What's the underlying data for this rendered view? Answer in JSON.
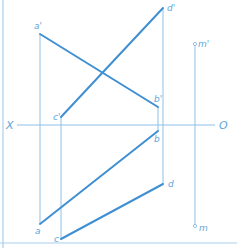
{
  "diagram": {
    "type": "orthographic-projection",
    "colors": {
      "thick_line": "#3f8fd2",
      "thin_line": "#8fc0e6",
      "label": "#5ea4da",
      "border": "#a9cfee"
    },
    "axis": {
      "left_label": "X",
      "right_label": "O"
    },
    "labels": {
      "a_prime": "a'",
      "b_prime": "b'",
      "c_prime": "c'",
      "d_prime": "d'",
      "m_prime": "m'",
      "a": "a",
      "b": "b",
      "c": "c",
      "d": "d",
      "m": "m"
    },
    "points": {
      "a_prime": [
        40,
        34
      ],
      "b_prime": [
        158,
        107
      ],
      "c_prime": [
        61,
        117
      ],
      "d_prime": [
        163,
        8
      ],
      "m_prime": [
        195,
        44
      ],
      "a": [
        40,
        224
      ],
      "b": [
        158,
        131
      ],
      "c": [
        61,
        239
      ],
      "d": [
        163,
        184
      ],
      "m": [
        195,
        226
      ]
    }
  }
}
